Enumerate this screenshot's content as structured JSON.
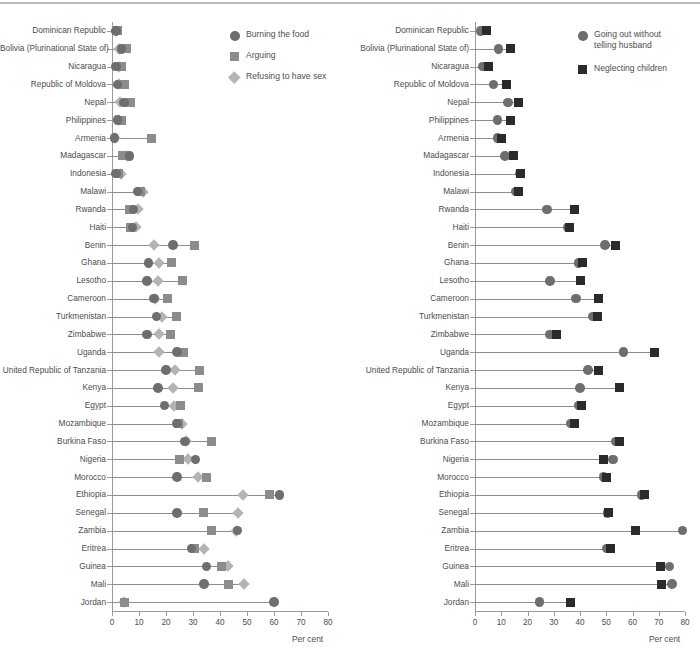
{
  "chart_data": [
    {
      "type": "scatter",
      "panel": "left",
      "title": "",
      "xlabel": "Per cent",
      "ylabel": "",
      "xlim": [
        0,
        80
      ],
      "xticks": [
        0,
        10,
        20,
        30,
        40,
        50,
        60,
        70,
        80
      ],
      "grid": false,
      "legend_position": "top-right",
      "legend": [
        {
          "name": "Burning the food",
          "marker": "circle",
          "color": "#6e6e6e"
        },
        {
          "name": "Arguing",
          "marker": "square",
          "color": "#8c8c8c"
        },
        {
          "name": "Refusing to have sex",
          "marker": "diamond",
          "color": "#b4b4b4"
        }
      ],
      "categories": [
        "Dominican Republic",
        "Bolivia (Plurinational State of)",
        "Nicaragua",
        "Republic of Moldova",
        "Nepal",
        "Philippines",
        "Armenia",
        "Madagascar",
        "Indonesia",
        "Malawi",
        "Rwanda",
        "Haiti",
        "Benin",
        "Ghana",
        "Lesotho",
        "Cameroon",
        "Turkmenistan",
        "Zimbabwe",
        "Uganda",
        "United Republic of Tanzania",
        "Kenya",
        "Egypt",
        "Mozambique",
        "Burkina Faso",
        "Nigeria",
        "Morocco",
        "Ethiopia",
        "Senegal",
        "Zambia",
        "Eritrea",
        "Guinea",
        "Mali",
        "Jordan"
      ],
      "series": [
        {
          "name": "Burning the food",
          "marker": "circle",
          "color": "#6e6e6e",
          "values": [
            1.5,
            3.5,
            1.5,
            2.0,
            4.5,
            2.0,
            1.0,
            6.5,
            1.5,
            9.5,
            8.0,
            7.5,
            22.5,
            13.5,
            13.0,
            15.5,
            16.5,
            13.0,
            24.0,
            20.0,
            17.0,
            19.5,
            24.0,
            27.0,
            31.0,
            24.0,
            62.0,
            24.0,
            46.5,
            29.5,
            35.0,
            34.0,
            60.0
          ]
        },
        {
          "name": "Arguing",
          "marker": "square",
          "color": "#8c8c8c",
          "values": [
            2.0,
            5.5,
            3.5,
            4.5,
            7.0,
            3.5,
            14.5,
            4.0,
            2.5,
            10.5,
            6.5,
            7.0,
            30.5,
            22.0,
            26.0,
            20.5,
            24.0,
            21.5,
            26.5,
            32.5,
            32.0,
            25.5,
            24.5,
            37.0,
            25.0,
            35.0,
            58.5,
            34.0,
            37.0,
            30.5,
            40.5,
            43.0,
            4.5
          ]
        },
        {
          "name": "Refusing to have sex",
          "marker": "diamond",
          "color": "#b4b4b4",
          "values": [
            1.5,
            2.5,
            2.5,
            2.5,
            3.0,
            2.5,
            1.0,
            5.5,
            3.5,
            11.5,
            9.5,
            9.0,
            15.5,
            17.5,
            17.0,
            16.0,
            18.5,
            17.5,
            17.5,
            23.5,
            22.5,
            23.0,
            26.0,
            27.5,
            28.0,
            32.0,
            48.5,
            46.5,
            46.0,
            34.0,
            43.0,
            49.0,
            4.5
          ]
        }
      ]
    },
    {
      "type": "scatter",
      "panel": "right",
      "title": "",
      "xlabel": "Per cent",
      "ylabel": "",
      "xlim": [
        0,
        80
      ],
      "xticks": [
        0,
        10,
        20,
        30,
        40,
        50,
        60,
        70,
        80
      ],
      "grid": false,
      "legend_position": "top-right",
      "legend": [
        {
          "name": "Going out without telling husband",
          "marker": "circle",
          "color": "#6e6e6e"
        },
        {
          "name": "Neglecting children",
          "marker": "square",
          "color": "#2b2b2b"
        }
      ],
      "categories": [
        "Dominican Republic",
        "Bolivia (Plurinational State of)",
        "Nicaragua",
        "Republic of Moldova",
        "Nepal",
        "Philippines",
        "Armenia",
        "Madagascar",
        "Indonesia",
        "Malawi",
        "Rwanda",
        "Haiti",
        "Benin",
        "Ghana",
        "Lesotho",
        "Cameroon",
        "Turkmenistan",
        "Zimbabwe",
        "Uganda",
        "United Republic of Tanzania",
        "Kenya",
        "Egypt",
        "Mozambique",
        "Burkina Faso",
        "Nigeria",
        "Morocco",
        "Ethiopia",
        "Senegal",
        "Zambia",
        "Eritrea",
        "Guinea",
        "Mali",
        "Jordan"
      ],
      "series": [
        {
          "name": "Going out without telling husband",
          "marker": "circle",
          "color": "#6e6e6e",
          "values": [
            2.0,
            9.0,
            3.0,
            7.0,
            12.5,
            8.5,
            8.5,
            11.5,
            17.0,
            15.5,
            27.5,
            35.5,
            49.5,
            39.5,
            28.5,
            38.5,
            45.0,
            28.5,
            56.5,
            43.0,
            40.0,
            39.5,
            36.5,
            53.5,
            52.5,
            49.0,
            63.5,
            50.5,
            79.0,
            50.0,
            74.0,
            75.0,
            24.5
          ]
        },
        {
          "name": "Neglecting children",
          "marker": "square",
          "color": "#2b2b2b",
          "values": [
            4.5,
            13.5,
            5.0,
            12.0,
            16.5,
            13.5,
            10.0,
            14.5,
            17.5,
            16.5,
            38.0,
            36.0,
            53.5,
            41.0,
            40.0,
            47.0,
            46.5,
            31.0,
            68.5,
            47.0,
            55.0,
            40.5,
            38.0,
            55.0,
            49.0,
            50.0,
            64.5,
            51.0,
            61.0,
            51.5,
            70.5,
            71.0,
            36.5
          ]
        }
      ]
    }
  ],
  "axis": {
    "tick_labels": [
      "0",
      "10",
      "20",
      "30",
      "40",
      "50",
      "60",
      "70",
      "80"
    ],
    "per_cent_label": "Per cent"
  },
  "left_legend": {
    "items": [
      {
        "label": "Burning the food",
        "marker": "circle"
      },
      {
        "label": "Arguing",
        "marker": "square"
      },
      {
        "label": "Refusing to have sex",
        "marker": "diamond"
      }
    ]
  },
  "right_legend": {
    "items": [
      {
        "label": "Going out without\ntelling husband",
        "marker": "circle"
      },
      {
        "label": "Neglecting children",
        "marker": "square"
      }
    ]
  },
  "colors": {
    "circle_left": "#6e6e6e",
    "square_left": "#8c8c8c",
    "diamond_left": "#b4b4b4",
    "circle_right": "#6e6e6e",
    "square_right": "#2b2b2b",
    "axis": "#9b9b9b",
    "text": "#4d4d4d"
  }
}
